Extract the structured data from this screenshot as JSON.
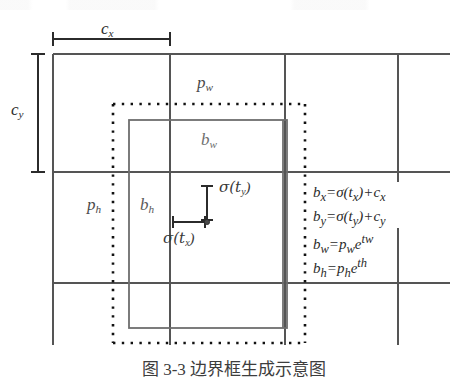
{
  "figure": {
    "type": "bounding-box-prediction-diagram",
    "title_visible": false,
    "caption": "图 3-3  边界框生成示意图",
    "labels": {
      "cx": "c",
      "cx_sub": "x",
      "cy": "c",
      "cy_sub": "y",
      "pw": "p",
      "pw_sub": "w",
      "ph": "p",
      "ph_sub": "h",
      "bw": "b",
      "bw_sub": "w",
      "bh": "b",
      "bh_sub": "h",
      "sigma": "σ",
      "sigma_tx": "σ(t",
      "sigma_tx_sub": "x",
      "sigma_tx_end": ")",
      "sigma_ty": "σ(t",
      "sigma_ty_sub": "y",
      "sigma_ty_end": ")"
    },
    "equations": [
      {
        "lhs": "b",
        "lhs_sub": "x",
        "eq": "=",
        "fn": "σ(t",
        "fn_sub": "x",
        "fn_end": ")",
        "op": "+",
        "rhs": "c",
        "rhs_sub": "x",
        "plain": "bx=σ(tx)+cx"
      },
      {
        "lhs": "b",
        "lhs_sub": "y",
        "eq": "=",
        "fn": "σ(t",
        "fn_sub": "y",
        "fn_end": ")",
        "op": "+",
        "rhs": "c",
        "rhs_sub": "y",
        "plain": "by=σ(ty)+cy"
      },
      {
        "lhs": "b",
        "lhs_sub": "w",
        "eq": "=",
        "fn": "p",
        "fn_sub": "w",
        "fn_end": "",
        "op": "e",
        "rhs": "",
        "rhs_sub": "tw",
        "plain": "bw=pw e^tw"
      },
      {
        "lhs": "b",
        "lhs_sub": "h",
        "eq": "=",
        "fn": "p",
        "fn_sub": "h",
        "fn_end": "",
        "op": "e",
        "rhs": "",
        "rhs_sub": "th",
        "plain": "bh=ph e^th"
      }
    ],
    "colors": {
      "grid_line": "#555555",
      "prior_box_dotted": "#1a1a1a",
      "predicted_box_solid": "#6a6a6a",
      "measure_line": "#2b2b2b",
      "background": "#ffffff",
      "text": "#2b2b2b"
    },
    "geometry": {
      "grid": {
        "x_lines": [
          53,
          170,
          285,
          398,
          450
        ],
        "y_lines": [
          54,
          172,
          283,
          345
        ],
        "cell_origin_x": 53,
        "cell_origin_y": 54,
        "cell_width": 117,
        "cell_height": 118
      },
      "prior_box_dotted": {
        "x": 113,
        "y": 104,
        "width": 192,
        "height": 239
      },
      "predicted_box_solid": {
        "x": 129,
        "y": 120,
        "width": 158,
        "height": 208
      },
      "center_point": {
        "x": 207,
        "y": 222
      },
      "cx_measure": {
        "x1": 53,
        "x2": 170,
        "y": 39
      },
      "cy_measure": {
        "y1": 54,
        "y2": 172,
        "x": 38
      },
      "sigma_tx_measure": {
        "x1": 173,
        "x2": 207,
        "y": 222
      },
      "sigma_ty_measure": {
        "y1": 186,
        "y2": 222,
        "x": 207
      }
    }
  }
}
